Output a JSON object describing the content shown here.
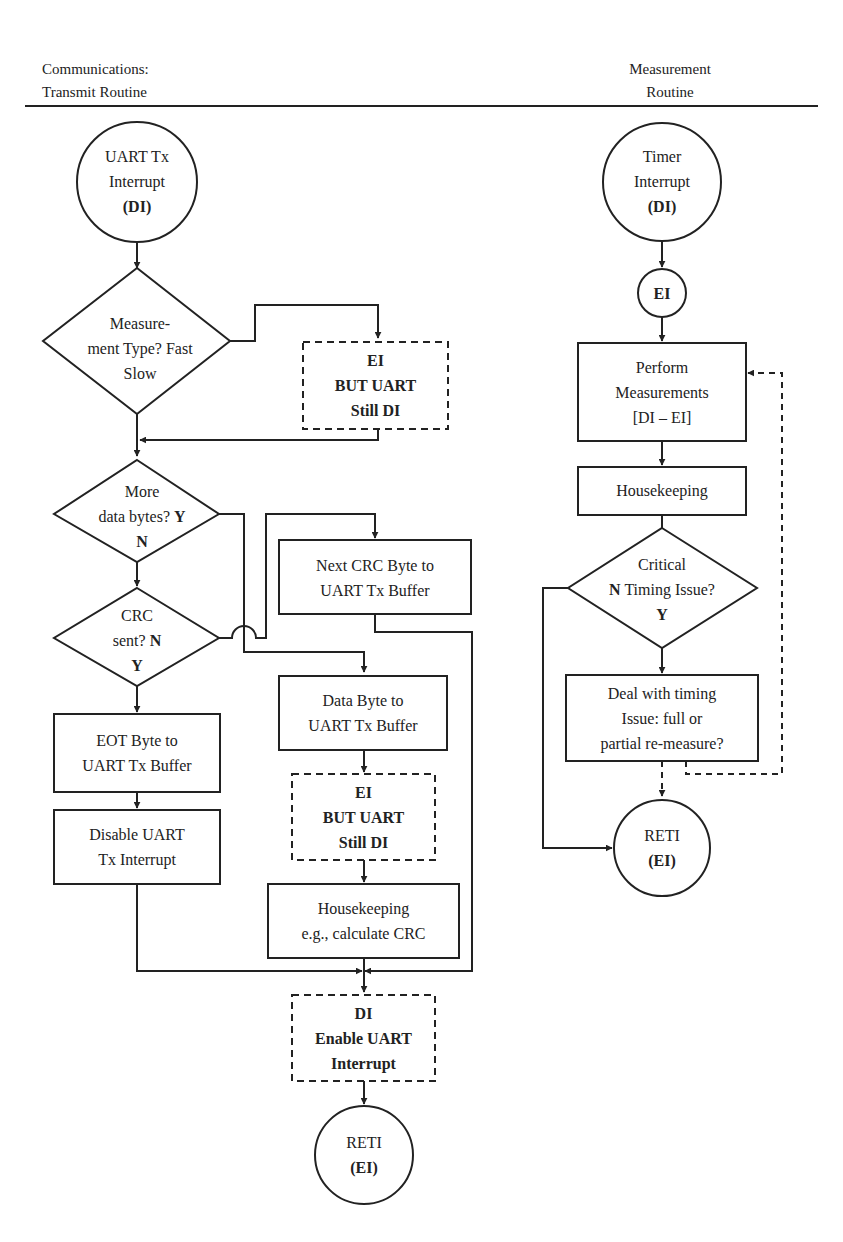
{
  "header": {
    "left_title_line1": "Communications:",
    "left_title_line2": "Transmit Routine",
    "right_title_line1": "Measurement",
    "right_title_line2": "Routine"
  },
  "transmit": {
    "start": {
      "line1": "UART Tx",
      "line2": "Interrupt",
      "line3": "(DI)"
    },
    "decision_type": {
      "line1": "Measure-",
      "line2": "ment Type?",
      "fast": "Fast",
      "slow": "Slow"
    },
    "ei_box_1": {
      "line1": "EI",
      "line2": "BUT UART",
      "line3": "Still DI"
    },
    "decision_more": {
      "line1": "More",
      "line2": "data bytes?",
      "yes": "Y",
      "no": "N"
    },
    "decision_crc": {
      "line1": "CRC",
      "line2": "sent?",
      "no": "N",
      "yes": "Y"
    },
    "next_crc_box": {
      "line1": "Next CRC Byte to",
      "line2": "UART Tx Buffer"
    },
    "data_byte_box": {
      "line1": "Data Byte to",
      "line2": "UART Tx Buffer"
    },
    "ei_box_2": {
      "line1": "EI",
      "line2": "BUT UART",
      "line3": "Still DI"
    },
    "housekeeping_box": {
      "line1": "Housekeeping",
      "line2": "e.g., calculate CRC"
    },
    "eot_box": {
      "line1": "EOT Byte to",
      "line2": "UART Tx Buffer"
    },
    "disable_box": {
      "line1": "Disable UART",
      "line2": "Tx Interrupt"
    },
    "di_enable_box": {
      "line1": "DI",
      "line2": "Enable UART",
      "line3": "Interrupt"
    },
    "end": {
      "line1": "RETI",
      "line2": "(EI)"
    }
  },
  "measurement": {
    "start": {
      "line1": "Timer",
      "line2": "Interrupt",
      "line3": "(DI)"
    },
    "ei_node": {
      "label": "EI"
    },
    "perform_box": {
      "line1": "Perform",
      "line2": "Measurements",
      "line3": "[DI – EI]"
    },
    "housekeeping_box": {
      "line1": "Housekeeping"
    },
    "decision_critical": {
      "line1": "Critical",
      "line2": "Timing Issue?",
      "no": "N",
      "yes": "Y"
    },
    "deal_box": {
      "line1": "Deal with timing",
      "line2": "Issue: full or",
      "line3": "partial re-measure?"
    },
    "end": {
      "line1": "RETI",
      "line2": "(EI)"
    }
  }
}
